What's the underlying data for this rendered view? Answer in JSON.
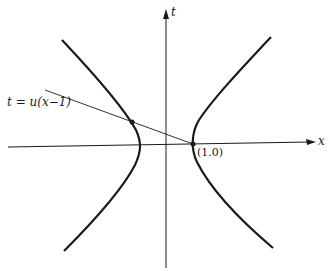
{
  "diagram": {
    "axes": {
      "horizontal_label": "x",
      "vertical_label": "t"
    },
    "line_label": "t = u(x−1)",
    "point_label": "(1.0)",
    "colors": {
      "ink": "#1a1a1a",
      "background": "#ffffff"
    }
  }
}
